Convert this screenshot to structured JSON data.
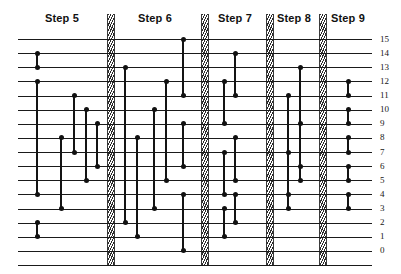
{
  "diagram": {
    "wire_count": 16,
    "wire_labels": [
      "15",
      "14",
      "13",
      "12",
      "11",
      "10",
      "9",
      "8",
      "7",
      "6",
      "5",
      "4",
      "3",
      "2",
      "1",
      "0"
    ],
    "geometry": {
      "top_wire_y": 39,
      "wire_spacing": 14.13,
      "wire_left": 18,
      "wire_right": 372,
      "label_x": 380,
      "bottom_rule_y": 265,
      "node_radius": 2.5
    },
    "colors": {
      "wire": "#1a1a1a",
      "node": "#111111",
      "connector": "#141414",
      "divider_hatch": "#2b2b2b",
      "background": "#ffffff",
      "text": "#111111"
    },
    "steps": [
      {
        "label": "Step 5",
        "center_x": 62,
        "start_x": 18,
        "end_x": 108
      },
      {
        "label": "Step 6",
        "center_x": 155,
        "start_x": 112,
        "end_x": 201
      },
      {
        "label": "Step 7",
        "center_x": 235,
        "start_x": 206,
        "end_x": 266
      },
      {
        "label": "Step 8",
        "center_x": 294,
        "start_x": 272,
        "end_x": 319
      },
      {
        "label": "Step 9",
        "center_x": 348,
        "start_x": 325,
        "end_x": 372
      }
    ],
    "dividers": [
      {
        "x": 107,
        "width": 6
      },
      {
        "x": 201,
        "width": 6
      },
      {
        "x": 266,
        "width": 6
      },
      {
        "x": 319,
        "width": 6
      }
    ],
    "connectors": [
      {
        "step": 5,
        "x": 37,
        "top": 14,
        "bottom": 13
      },
      {
        "step": 5,
        "x": 37,
        "top": 12,
        "bottom": 4
      },
      {
        "step": 5,
        "x": 37,
        "top": 2,
        "bottom": 1
      },
      {
        "step": 5,
        "x": 61,
        "top": 8,
        "bottom": 3
      },
      {
        "step": 5,
        "x": 74,
        "top": 11,
        "bottom": 7
      },
      {
        "step": 5,
        "x": 86,
        "top": 10,
        "bottom": 5
      },
      {
        "step": 5,
        "x": 97,
        "top": 9,
        "bottom": 6
      },
      {
        "step": 6,
        "x": 125,
        "top": 13,
        "bottom": 2
      },
      {
        "step": 6,
        "x": 137,
        "top": 8,
        "bottom": 1
      },
      {
        "step": 6,
        "x": 154,
        "top": 10,
        "bottom": 3
      },
      {
        "step": 6,
        "x": 166,
        "top": 12,
        "bottom": 5
      },
      {
        "step": 6,
        "x": 183,
        "top": 15,
        "bottom": 11
      },
      {
        "step": 6,
        "x": 183,
        "top": 9,
        "bottom": 6
      },
      {
        "step": 6,
        "x": 183,
        "top": 4,
        "bottom": 0
      },
      {
        "step": 7,
        "x": 224,
        "top": 12,
        "bottom": 9
      },
      {
        "step": 7,
        "x": 235,
        "top": 14,
        "bottom": 11
      },
      {
        "step": 7,
        "x": 224,
        "top": 7,
        "bottom": 4
      },
      {
        "step": 7,
        "x": 235,
        "top": 8,
        "bottom": 5
      },
      {
        "step": 7,
        "x": 224,
        "top": 3,
        "bottom": 1
      },
      {
        "step": 7,
        "x": 235,
        "top": 4,
        "bottom": 2
      },
      {
        "step": 8,
        "x": 288,
        "top": 11,
        "bottom": 4
      },
      {
        "step": 8,
        "x": 300,
        "top": 13,
        "bottom": 6
      },
      {
        "step": 8,
        "x": 288,
        "top": 7,
        "bottom": 3
      },
      {
        "step": 8,
        "x": 300,
        "top": 9,
        "bottom": 5
      },
      {
        "step": 9,
        "x": 348,
        "top": 12,
        "bottom": 11
      },
      {
        "step": 9,
        "x": 348,
        "top": 10,
        "bottom": 9
      },
      {
        "step": 9,
        "x": 348,
        "top": 8,
        "bottom": 7
      },
      {
        "step": 9,
        "x": 348,
        "top": 6,
        "bottom": 5
      },
      {
        "step": 9,
        "x": 348,
        "top": 4,
        "bottom": 3
      }
    ]
  }
}
